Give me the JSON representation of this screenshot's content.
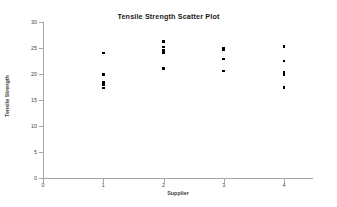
{
  "chart_data": {
    "type": "scatter",
    "title": "Tensile Strength Scatter Plot",
    "xlabel": "Supplier",
    "ylabel": "Tensile Strength",
    "xlim": [
      0,
      4.5
    ],
    "ylim": [
      0,
      30
    ],
    "xticks": [
      "0",
      "1",
      "2",
      "3",
      "4"
    ],
    "xtick_values": [
      0,
      1,
      2,
      3,
      4
    ],
    "yticks": [
      "0",
      "5",
      "10",
      "15",
      "20",
      "25",
      "30"
    ],
    "ytick_values": [
      0,
      5,
      10,
      15,
      20,
      25,
      30
    ],
    "grid": false,
    "legend": false,
    "marker": "square",
    "marker_color": "#000000",
    "series": [
      {
        "name": "Tensile Strength",
        "points": [
          {
            "x": 1,
            "y": 24.0
          },
          {
            "x": 1,
            "y": 19.9
          },
          {
            "x": 1,
            "y": 18.4
          },
          {
            "x": 1,
            "y": 18.0
          },
          {
            "x": 1,
            "y": 17.3
          },
          {
            "x": 2,
            "y": 26.2
          },
          {
            "x": 2,
            "y": 25.2
          },
          {
            "x": 2,
            "y": 24.6
          },
          {
            "x": 2,
            "y": 24.1
          },
          {
            "x": 2,
            "y": 21.1
          },
          {
            "x": 3,
            "y": 25.0
          },
          {
            "x": 3,
            "y": 24.7
          },
          {
            "x": 3,
            "y": 22.9
          },
          {
            "x": 3,
            "y": 20.6
          },
          {
            "x": 4,
            "y": 25.3
          },
          {
            "x": 4,
            "y": 22.5
          },
          {
            "x": 4,
            "y": 20.4
          },
          {
            "x": 4,
            "y": 19.9
          },
          {
            "x": 4,
            "y": 17.4
          }
        ]
      }
    ]
  }
}
